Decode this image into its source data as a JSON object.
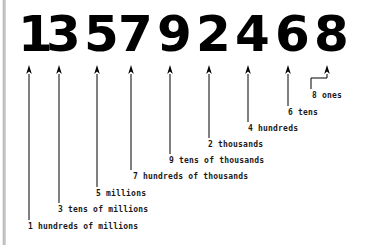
{
  "diagram": {
    "number": "135792468",
    "digits": [
      {
        "digit": "1",
        "x": 18,
        "width": 26,
        "arrow_x": 29,
        "label": "1 hundreds of millions",
        "label_x": 28,
        "label_y": 222,
        "line_bottom": 220
      },
      {
        "digit": "3",
        "x": 46,
        "width": 26,
        "arrow_x": 59,
        "label": "3 tens of millions",
        "label_x": 58,
        "label_y": 205,
        "line_bottom": 203
      },
      {
        "digit": "5",
        "x": 84,
        "width": 26,
        "arrow_x": 97,
        "label": "5 millions",
        "label_x": 96,
        "label_y": 189,
        "line_bottom": 187
      },
      {
        "digit": "7",
        "x": 118,
        "width": 26,
        "arrow_x": 131,
        "label": "7 hundreds of thousands",
        "label_x": 133,
        "label_y": 172,
        "line_bottom": 170
      },
      {
        "digit": "9",
        "x": 157,
        "width": 26,
        "arrow_x": 170,
        "label": "9 tens of thousands",
        "label_x": 169,
        "label_y": 156,
        "line_bottom": 154
      },
      {
        "digit": "2",
        "x": 196,
        "width": 26,
        "arrow_x": 209,
        "label": "2 thousands",
        "label_x": 208,
        "label_y": 140,
        "line_bottom": 138
      },
      {
        "digit": "4",
        "x": 235,
        "width": 26,
        "arrow_x": 248,
        "label": "4 hundreds",
        "label_x": 248,
        "label_y": 124,
        "line_bottom": 122
      },
      {
        "digit": "6",
        "x": 275,
        "width": 26,
        "arrow_x": 288,
        "label": "6 tens",
        "label_x": 288,
        "label_y": 108,
        "line_bottom": 106
      },
      {
        "digit": "8",
        "x": 314,
        "width": 26,
        "arrow_x": 327,
        "label": "8 ones",
        "label_x": 312,
        "label_y": 91,
        "line_bottom": 78,
        "elbow": true,
        "elbow_x": 311,
        "elbow_y": 78,
        "elbow_bottom": 89
      }
    ],
    "colors": {
      "digit": "#000000",
      "label": "#1a1a1a",
      "arrow": "#000000",
      "background": "#ffffff",
      "page_edge": "#b8b8b8"
    }
  }
}
